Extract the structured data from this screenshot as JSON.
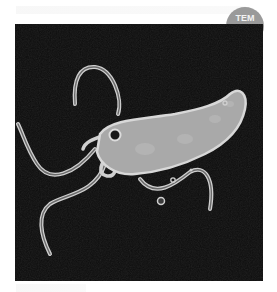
{
  "badge": {
    "label": "TEM",
    "color": "#9a9a9a"
  },
  "image": {
    "subject": "flagellated rod-shaped bacterium",
    "description": "transmission electron micrograph of a bacterium with multiple flagella",
    "background_color": "#0c0c0c",
    "cell_color": "#a8a8a8"
  }
}
